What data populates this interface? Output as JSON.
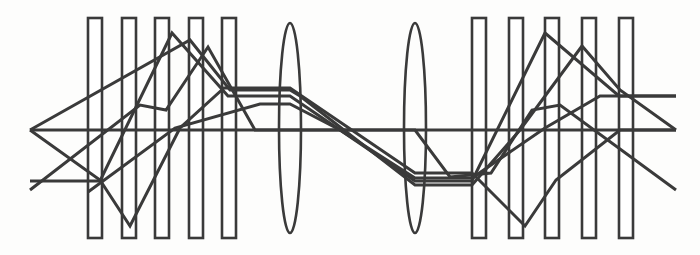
{
  "figure": {
    "canvas": {
      "width": 700,
      "height": 255
    },
    "colors": {
      "stroke": "#3a3a3a",
      "background": "#fdfdfc",
      "fill": "#ffffff"
    },
    "stroke_widths": {
      "bar": 2.6,
      "lens": 2.6,
      "ray": 3.0,
      "axis": 3.0
    }
  },
  "optical_axis": {
    "label": "optical-axis",
    "y": 130,
    "x_start": 30,
    "x_end": 676
  },
  "elements": {
    "bar_top": 18,
    "bar_bottom": 238,
    "bar_width": 14,
    "left_group_label": "left-plate-group",
    "right_group_label": "right-plate-group",
    "left_bars_x": [
      88,
      122,
      155,
      189,
      222
    ],
    "right_bars_x": [
      472,
      509,
      545,
      582,
      619
    ],
    "lens_label": "biconvex-lens",
    "lenses": [
      {
        "name": "lens-1",
        "cx": 290,
        "cy": 128,
        "rx": 11,
        "ry": 105
      },
      {
        "name": "lens-2",
        "cx": 415,
        "cy": 128,
        "rx": 11,
        "ry": 105
      }
    ]
  },
  "rays": [
    {
      "name": "ray-1",
      "points": "30,181 100,181 172,33 228,96 290,96 415,181 472,181 545,33 619,96 676,96"
    },
    {
      "name": "ray-2",
      "points": "30,190 140,105 166,110 208,47 255,130 290,130 415,130 450,177 491,173 532,110 560,105 676,190"
    },
    {
      "name": "ray-3",
      "points": "30,130 100,180 130,226 180,128 224,88 290,88 415,173 472,173 525,226 556,180 620,130 676,130"
    },
    {
      "name": "ray-4",
      "points": "30,130 190,40 230,90 290,90 300,96 415,185 472,185 520,130 582,46 620,90 676,130"
    },
    {
      "name": "ray-5",
      "points": "88,192 175,128 260,104 290,104 340,130 415,178 472,178 545,128 600,96 676,96"
    }
  ],
  "legend": {
    "axis_name": "optical axis",
    "plate_name": "plate element",
    "lens_name": "biconvex lens",
    "ray_name": "traced ray"
  }
}
